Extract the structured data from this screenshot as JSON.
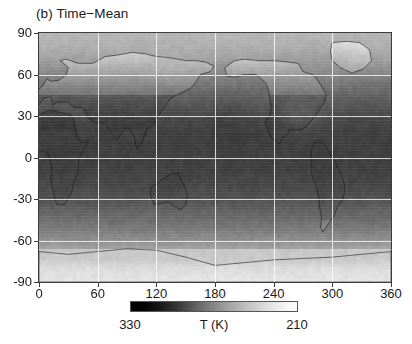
{
  "panel": {
    "title": "(b) Time−Mean"
  },
  "axes": {
    "x": {
      "label": "",
      "ticks": [
        0,
        60,
        120,
        180,
        240,
        300,
        360
      ],
      "range": [
        0,
        360
      ]
    },
    "y": {
      "label": "",
      "ticks": [
        90,
        60,
        30,
        0,
        -30,
        -60,
        -90
      ],
      "range": [
        -90,
        90
      ]
    },
    "grid": true
  },
  "colorbar": {
    "min_label": "330",
    "max_label": "210",
    "unit_label": "T (K)",
    "orientation": "horizontal",
    "reversed": true,
    "colormap": "grayscale-reversed",
    "low_color": "#ffffff",
    "high_color": "#000000"
  },
  "chart_data": {
    "type": "heatmap",
    "title": "(b) Time−Mean",
    "xlabel": "",
    "ylabel": "",
    "xlim": [
      0,
      360
    ],
    "ylim": [
      -90,
      90
    ],
    "zlabel": "T (K)",
    "zlim": [
      210,
      330
    ],
    "zlim_display": [
      330,
      210
    ],
    "grid": true,
    "legend": "colorbar-below",
    "x_ticks": [
      0,
      60,
      120,
      180,
      240,
      300,
      360
    ],
    "y_ticks": [
      90,
      60,
      30,
      0,
      -30,
      -60,
      -90
    ],
    "colormap": "gray_r",
    "x": [
      0,
      15,
      30,
      45,
      60,
      75,
      90,
      105,
      120,
      135,
      150,
      165,
      180,
      195,
      210,
      225,
      240,
      255,
      270,
      285,
      300,
      315,
      330,
      345,
      360
    ],
    "y": [
      90,
      80,
      70,
      60,
      50,
      40,
      30,
      20,
      10,
      0,
      -10,
      -20,
      -30,
      -40,
      -50,
      -60,
      -70,
      -80,
      -90
    ],
    "zonal_mean_values": [
      {
        "lat": 90,
        "T": 245
      },
      {
        "lat": 80,
        "T": 248
      },
      {
        "lat": 70,
        "T": 256
      },
      {
        "lat": 60,
        "T": 268
      },
      {
        "lat": 50,
        "T": 279
      },
      {
        "lat": 40,
        "T": 288
      },
      {
        "lat": 30,
        "T": 295
      },
      {
        "lat": 20,
        "T": 299
      },
      {
        "lat": 10,
        "T": 300
      },
      {
        "lat": 0,
        "T": 300
      },
      {
        "lat": -10,
        "T": 299
      },
      {
        "lat": -20,
        "T": 296
      },
      {
        "lat": -30,
        "T": 291
      },
      {
        "lat": -40,
        "T": 283
      },
      {
        "lat": -50,
        "T": 275
      },
      {
        "lat": -60,
        "T": 263
      },
      {
        "lat": -70,
        "T": 248
      },
      {
        "lat": -80,
        "T": 233
      },
      {
        "lat": -90,
        "T": 228
      }
    ],
    "notable_features": [
      {
        "name": "Greenland cold anomaly",
        "lon": 315,
        "lat": 73,
        "T": 248
      },
      {
        "name": "Antarctica cold plateau",
        "lon": 180,
        "lat": -85,
        "T": 225
      },
      {
        "name": "Sahara warm region",
        "lon": 15,
        "lat": 22,
        "T": 305
      },
      {
        "name": "Tropical warm pool",
        "lon": 150,
        "lat": 0,
        "T": 301
      },
      {
        "name": "Siberia cold region",
        "lon": 110,
        "lat": 65,
        "T": 262
      },
      {
        "name": "Tibetan Plateau cold region",
        "lon": 88,
        "lat": 33,
        "T": 275
      }
    ]
  }
}
